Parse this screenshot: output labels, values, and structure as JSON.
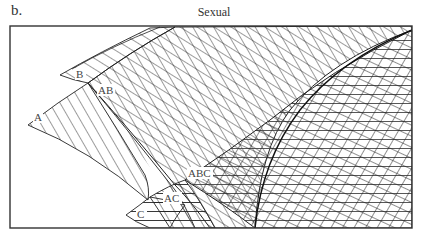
{
  "figure": {
    "panel_label": "b.",
    "title": "Sexual"
  },
  "regions": [
    {
      "id": "A",
      "label": "A",
      "hatch": "steep-diagonal"
    },
    {
      "id": "B",
      "label": "B",
      "hatch": "shallow-diagonal"
    },
    {
      "id": "C",
      "label": "C",
      "hatch": "horizontal"
    },
    {
      "id": "AB",
      "label": "AB",
      "hatch": "crosshatch"
    },
    {
      "id": "AC",
      "label": "AC",
      "hatch": "diagonal-horizontal"
    },
    {
      "id": "ABC",
      "label": "ABC",
      "hatch": "triple"
    }
  ],
  "colors": {
    "line": "#222222",
    "background": "#ffffff",
    "frame": "#333333"
  }
}
